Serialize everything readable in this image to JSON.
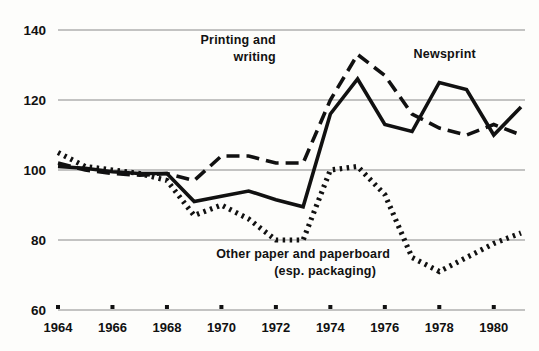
{
  "chart_data": {
    "type": "line",
    "title": "",
    "subtitle": "",
    "xlabel": "",
    "ylabel": "",
    "xlim": [
      1964,
      1981
    ],
    "ylim": [
      60,
      140
    ],
    "grid": true,
    "gridlines_y": [
      60,
      80,
      100,
      120,
      140
    ],
    "legend_position": "inline-annotations",
    "x": [
      1964,
      1965,
      1966,
      1967,
      1968,
      1969,
      1970,
      1971,
      1972,
      1973,
      1974,
      1975,
      1976,
      1977,
      1978,
      1979,
      1980,
      1981
    ],
    "y_ticks": [
      60,
      80,
      100,
      120,
      140
    ],
    "y_tick_labels": [
      "60",
      "80",
      "100",
      "120",
      "140"
    ],
    "x_ticks": [
      1964,
      1966,
      1968,
      1970,
      1972,
      1974,
      1976,
      1978,
      1980
    ],
    "x_tick_labels": [
      "1964",
      "1966",
      "1968",
      "1970",
      "1972",
      "1974",
      "1976",
      "1978",
      "1980"
    ],
    "series": [
      {
        "name": "Printing and writing",
        "style": "dashed",
        "color": "#111111",
        "values": [
          102,
          100,
          99,
          98.5,
          99,
          97,
          104,
          104,
          102,
          102,
          120,
          133,
          127,
          116,
          112,
          110,
          113,
          110
        ]
      },
      {
        "name": "Newsprint",
        "style": "solid",
        "color": "#111111",
        "values": [
          101,
          100.5,
          99.5,
          99,
          99,
          91,
          92.5,
          94,
          91.5,
          89.5,
          116,
          126,
          113,
          111,
          125,
          123,
          110,
          118
        ]
      },
      {
        "name": "Other paper and paperboard (esp. packaging)",
        "style": "dotted",
        "color": "#111111",
        "values": [
          105,
          101,
          100,
          99,
          97,
          87,
          90,
          86,
          80,
          80,
          100,
          101,
          93,
          75,
          71,
          75,
          79,
          82
        ]
      }
    ],
    "annotations": [
      {
        "id": "printing-writing",
        "line1": "Printing and",
        "line2": "writing",
        "x": 1972.0,
        "y": 136
      },
      {
        "id": "newsprint",
        "line1": "Newsprint",
        "line2": "",
        "x": 1978.2,
        "y": 132
      },
      {
        "id": "other-paper",
        "line1": "Other paper and paperboard",
        "line2": "(esp. packaging)",
        "x": 1973.0,
        "y": 75
      }
    ]
  },
  "axis": {
    "y_labels": [
      "140",
      "120",
      "100",
      "80",
      "60"
    ],
    "x_labels": [
      "1964",
      "1966",
      "1968",
      "1970",
      "1972",
      "1974",
      "1976",
      "1978",
      "1980"
    ]
  },
  "annotations": {
    "printing_line1": "Printing and",
    "printing_line2": "writing",
    "newsprint": "Newsprint",
    "other_line1": "Other paper and paperboard",
    "other_line2": "(esp. packaging)"
  },
  "colors": {
    "ink": "#111111",
    "gridline": "#8a8a8a",
    "background": "#fdfdfb"
  }
}
